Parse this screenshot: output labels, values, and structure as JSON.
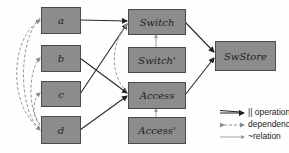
{
  "diagram": {
    "nodes": {
      "a": "a",
      "b": "b",
      "c": "c",
      "d": "d",
      "switch": "Switch",
      "switch_prime": "Switch'",
      "access": "Access",
      "access_prime": "Access'",
      "swstore": "SwStore"
    },
    "edges": [
      {
        "from": "a",
        "to": "Switch",
        "type": "parallel-operation"
      },
      {
        "from": "c",
        "to": "Switch",
        "type": "parallel-operation"
      },
      {
        "from": "b",
        "to": "Access",
        "type": "parallel-operation"
      },
      {
        "from": "d",
        "to": "Access",
        "type": "parallel-operation"
      },
      {
        "from": "Switch",
        "to": "SwStore",
        "type": "parallel-operation"
      },
      {
        "from": "Access",
        "to": "SwStore",
        "type": "parallel-operation"
      },
      {
        "from": "Switch'",
        "to": "Switch",
        "type": "relation"
      },
      {
        "from": "Access'",
        "to": "Access",
        "type": "relation"
      },
      {
        "from": "d",
        "to": "a",
        "type": "dependency"
      },
      {
        "from": "d",
        "to": "b",
        "type": "dependency"
      },
      {
        "from": "d",
        "to": "c",
        "type": "dependency"
      },
      {
        "from": "a",
        "to": "d",
        "type": "dependency"
      },
      {
        "from": "Access",
        "to": "Switch",
        "type": "dependency"
      }
    ],
    "legend": {
      "operation": "|| operation",
      "dependency": "dependency",
      "relation": "~relation"
    },
    "colors": {
      "node_fill": "#8c8c8c",
      "node_border": "#4a4a4a",
      "edge": "#2a2a2a",
      "dashed": "#888888"
    }
  }
}
